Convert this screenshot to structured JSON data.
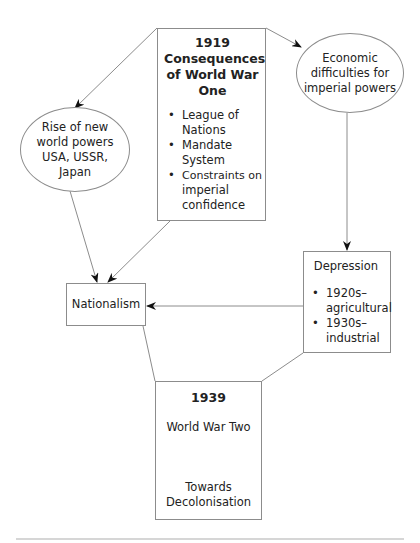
{
  "diagram": {
    "type": "flow-diagram",
    "nodes": {
      "consequences": {
        "year": "1919",
        "title_lines": [
          "Consequences",
          "of World War",
          "One"
        ],
        "bullets": [
          [
            "League of",
            "Nations"
          ],
          [
            "Mandate",
            "System"
          ],
          [
            "Constraints on",
            "imperial",
            "confidence"
          ]
        ]
      },
      "new_powers": {
        "lines": [
          "Rise of new",
          "world powers",
          "USA, USSR,",
          "Japan"
        ]
      },
      "economic": {
        "lines": [
          "Economic",
          "difficulties for",
          "imperial powers"
        ]
      },
      "depression": {
        "title": "Depression",
        "bullets": [
          [
            "1920s–",
            "agricultural"
          ],
          [
            "1930s–",
            "industrial"
          ]
        ]
      },
      "nationalism": {
        "label": "Nationalism"
      },
      "ww2": {
        "year": "1939",
        "subtitle": "World War Two",
        "result_lines": [
          "Towards",
          "Decolonisation"
        ]
      }
    },
    "edges": [
      {
        "from": "consequences",
        "to": "new_powers",
        "arrow": true
      },
      {
        "from": "consequences",
        "to": "economic",
        "arrow": true
      },
      {
        "from": "new_powers",
        "to": "nationalism",
        "arrow": true
      },
      {
        "from": "consequences",
        "to": "nationalism",
        "arrow": true
      },
      {
        "from": "economic",
        "to": "depression",
        "arrow": true
      },
      {
        "from": "depression",
        "to": "nationalism",
        "arrow": true
      },
      {
        "from": "nationalism",
        "to": "ww2",
        "arrow": false
      },
      {
        "from": "depression",
        "to": "ww2",
        "arrow": false
      },
      {
        "from": "ww2.subtitle",
        "to": "ww2.result",
        "arrow": true
      }
    ],
    "colors": {
      "line": "#8c8c8c",
      "text": "#222222",
      "arrowhead": "#111111",
      "footer_rule": "#c8c8c8"
    }
  }
}
